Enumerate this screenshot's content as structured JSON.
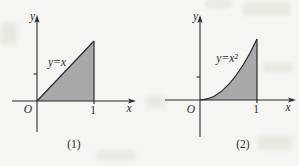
{
  "colors": {
    "paper": "#f6f5f1",
    "ink": "#2b2b2b",
    "shade": "#a9a9a9"
  },
  "figure": {
    "description_type": "function-area-diagrams",
    "panels": [
      {
        "caption": "(1)",
        "function_label": "y=x",
        "y_axis_label": "y",
        "x_axis_label": "x",
        "origin_label": "O",
        "x_tick_label": "1"
      },
      {
        "caption": "(2)",
        "function_label": "y=x²",
        "y_axis_label": "y",
        "x_axis_label": "x",
        "origin_label": "O",
        "x_tick_label": "1"
      }
    ]
  }
}
